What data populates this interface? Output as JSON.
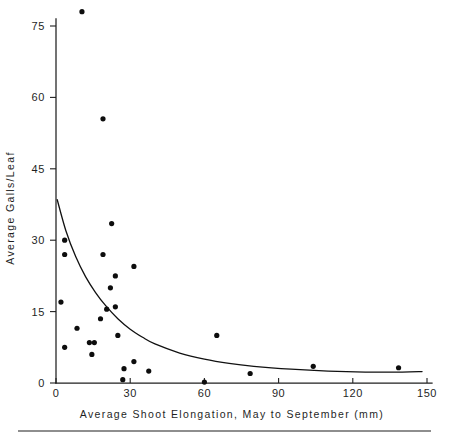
{
  "chart_data": {
    "type": "scatter",
    "title": "",
    "xlabel": "Average Shoot Elongation, May to September  (mm)",
    "ylabel": "Average Galls/Leaf",
    "xlim": [
      0,
      150
    ],
    "ylim": [
      0,
      80
    ],
    "xticks": [
      0,
      30,
      60,
      90,
      120,
      150
    ],
    "xtick_labels": [
      "0",
      "30",
      "60",
      "90",
      "120",
      "150"
    ],
    "yticks": [
      0,
      15,
      30,
      45,
      60,
      75
    ],
    "ytick_labels": [
      "0",
      "15",
      "30",
      "45",
      "60",
      "75"
    ],
    "grid": false,
    "legend": null,
    "points": [
      {
        "x": 10.5,
        "y": 78.0
      },
      {
        "x": 19.0,
        "y": 55.5
      },
      {
        "x": 22.5,
        "y": 33.5
      },
      {
        "x": 3.5,
        "y": 30.0
      },
      {
        "x": 3.5,
        "y": 27.0
      },
      {
        "x": 19.0,
        "y": 27.0
      },
      {
        "x": 31.5,
        "y": 24.5
      },
      {
        "x": 24.0,
        "y": 22.5
      },
      {
        "x": 22.0,
        "y": 20.0
      },
      {
        "x": 2.0,
        "y": 17.0
      },
      {
        "x": 20.5,
        "y": 15.5
      },
      {
        "x": 24.0,
        "y": 16.0
      },
      {
        "x": 18.0,
        "y": 13.5
      },
      {
        "x": 8.5,
        "y": 11.5
      },
      {
        "x": 25.0,
        "y": 10.0
      },
      {
        "x": 65.0,
        "y": 10.0
      },
      {
        "x": 13.5,
        "y": 8.5
      },
      {
        "x": 15.5,
        "y": 8.5
      },
      {
        "x": 3.5,
        "y": 7.5
      },
      {
        "x": 14.5,
        "y": 6.0
      },
      {
        "x": 31.5,
        "y": 4.5
      },
      {
        "x": 27.5,
        "y": 3.0
      },
      {
        "x": 37.5,
        "y": 2.5
      },
      {
        "x": 104.0,
        "y": 3.5
      },
      {
        "x": 138.5,
        "y": 3.2
      },
      {
        "x": 78.5,
        "y": 2.0
      },
      {
        "x": 27.0,
        "y": 0.7
      },
      {
        "x": 60.0,
        "y": 0.2
      }
    ],
    "fit_curve": {
      "description": "exponential-decay trend line",
      "x_start": 0.5,
      "x_end": 148.0,
      "points": [
        {
          "x": 0.5,
          "y": 38.5
        },
        {
          "x": 4.0,
          "y": 32.0
        },
        {
          "x": 8.0,
          "y": 26.5
        },
        {
          "x": 12.0,
          "y": 22.3
        },
        {
          "x": 16.0,
          "y": 19.0
        },
        {
          "x": 20.0,
          "y": 16.3
        },
        {
          "x": 25.0,
          "y": 13.5
        },
        {
          "x": 30.0,
          "y": 11.3
        },
        {
          "x": 35.0,
          "y": 9.6
        },
        {
          "x": 40.0,
          "y": 8.2
        },
        {
          "x": 50.0,
          "y": 6.3
        },
        {
          "x": 60.0,
          "y": 5.0
        },
        {
          "x": 70.0,
          "y": 4.1
        },
        {
          "x": 80.0,
          "y": 3.5
        },
        {
          "x": 95.0,
          "y": 2.9
        },
        {
          "x": 110.0,
          "y": 2.5
        },
        {
          "x": 125.0,
          "y": 2.3
        },
        {
          "x": 140.0,
          "y": 2.3
        },
        {
          "x": 148.0,
          "y": 2.4
        }
      ]
    }
  }
}
